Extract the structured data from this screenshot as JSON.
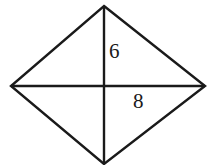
{
  "figure": {
    "type": "geometry-diagram",
    "shape_name": "rhombus",
    "background_color": "#ffffff",
    "stroke_color": "#1a1a1a",
    "stroke_width": 2.4,
    "canvas": {
      "width": 216,
      "height": 165
    },
    "vertices": {
      "top": {
        "x": 104,
        "y": 6
      },
      "right": {
        "x": 205,
        "y": 86
      },
      "bottom": {
        "x": 104,
        "y": 164
      },
      "left": {
        "x": 11,
        "y": 86
      }
    },
    "center": {
      "x": 104,
      "y": 86
    },
    "outline_path": "M 104 6 L 205 86 L 104 164 L 11 86 Z",
    "diagonals": [
      {
        "name": "vertical-diagonal",
        "x1": 104,
        "y1": 6,
        "x2": 104,
        "y2": 164
      },
      {
        "name": "horizontal-diagonal",
        "x1": 11,
        "y1": 86,
        "x2": 205,
        "y2": 86
      }
    ],
    "labels": [
      {
        "id": "six",
        "text": "6",
        "x": 109,
        "y": 41,
        "describes": "upper half of vertical diagonal",
        "color": "#1a1a1a"
      },
      {
        "id": "eight",
        "text": "8",
        "x": 133,
        "y": 91,
        "describes": "right half of horizontal diagonal",
        "color": "#1a1a1a"
      }
    ]
  }
}
